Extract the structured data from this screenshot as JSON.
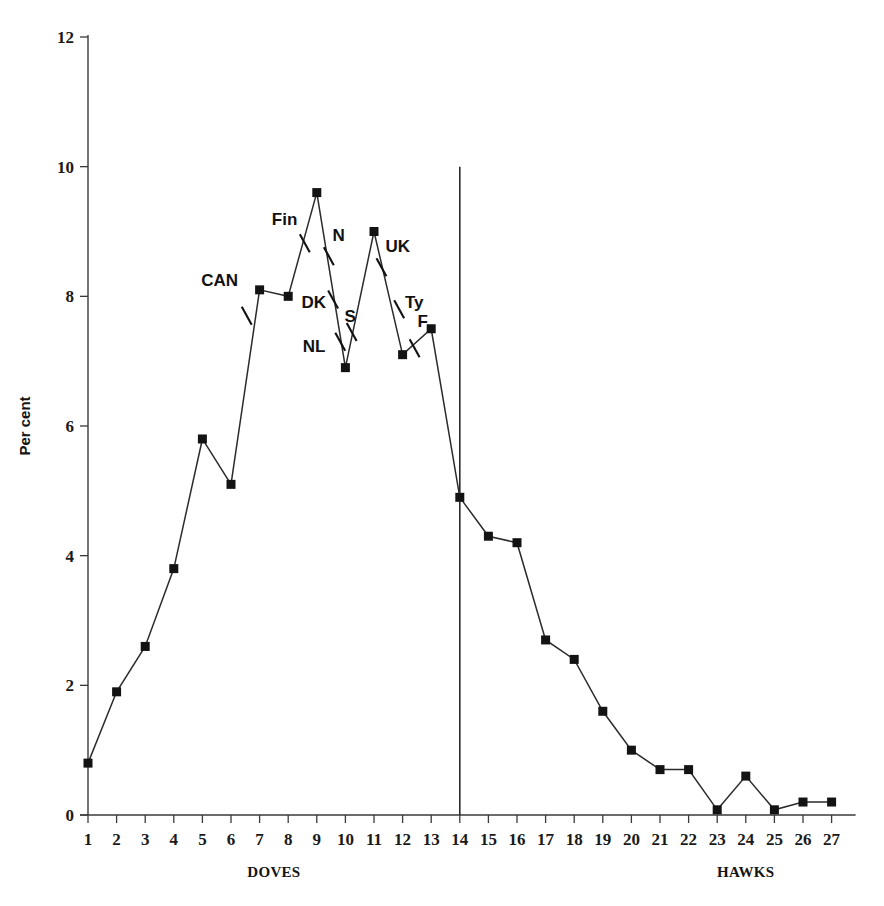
{
  "chart_data": {
    "type": "line",
    "title": "",
    "subtitle": "",
    "xlabel": "",
    "ylabel": "Per cent",
    "xlim": [
      0.4,
      27.6
    ],
    "ylim": [
      0,
      12
    ],
    "grid": false,
    "legend_position": "none",
    "x_tick_labels": [
      "1",
      "2",
      "3",
      "4",
      "5",
      "6",
      "7",
      "8",
      "9",
      "10",
      "11",
      "12",
      "13",
      "14",
      "15",
      "16",
      "17",
      "18",
      "19",
      "20",
      "21",
      "22",
      "23",
      "24",
      "25",
      "26",
      "27"
    ],
    "y_tick_labels": [
      "0",
      "2",
      "4",
      "6",
      "8",
      "10",
      "12"
    ],
    "y_ticks": [
      0,
      2,
      4,
      6,
      8,
      10,
      12
    ],
    "x": [
      1,
      2,
      3,
      4,
      5,
      6,
      7,
      8,
      9,
      10,
      11,
      12,
      13,
      14,
      15,
      16,
      17,
      18,
      19,
      20,
      21,
      22,
      23,
      24,
      25,
      26,
      27
    ],
    "values": [
      0.8,
      1.9,
      2.6,
      3.8,
      5.8,
      5.1,
      8.1,
      8.0,
      9.6,
      6.9,
      9.0,
      7.1,
      7.5,
      4.9,
      4.3,
      4.2,
      2.7,
      2.4,
      1.6,
      1.0,
      0.7,
      0.7,
      0.08,
      0.6,
      0.08,
      0.2,
      0.2
    ],
    "series": [
      {
        "name": "distribution",
        "values": [
          0.8,
          1.9,
          2.6,
          3.8,
          5.8,
          5.1,
          8.1,
          8.0,
          9.6,
          6.9,
          9.0,
          7.1,
          7.5,
          4.9,
          4.3,
          4.2,
          2.7,
          2.4,
          1.6,
          1.0,
          0.7,
          0.7,
          0.08,
          0.6,
          0.08,
          0.2,
          0.2
        ]
      }
    ],
    "marker_style": "filled-square",
    "line_color": "#2b2b2b",
    "marker_color": "#131313",
    "axis_group_labels": [
      {
        "text": "DOVES",
        "x_center": 7.5
      },
      {
        "text": "HAWKS",
        "x_center": 24.0
      }
    ],
    "reference_lines": [
      {
        "orientation": "vertical",
        "x": 14,
        "y_from": 0,
        "y_to": 10.0,
        "label": ""
      }
    ],
    "annotations": [
      {
        "text": "CAN",
        "x": 6.25,
        "y": 8.25,
        "anchor": "end",
        "tick_x": 6.55,
        "tick_y": 7.7
      },
      {
        "text": "Fin",
        "x": 8.32,
        "y": 9.2,
        "anchor": "end",
        "tick_x": 8.58,
        "tick_y": 8.82
      },
      {
        "text": "N",
        "x": 9.55,
        "y": 8.95,
        "anchor": "start",
        "tick_x": 9.42,
        "tick_y": 8.62
      },
      {
        "text": "DK",
        "x": 9.32,
        "y": 7.92,
        "anchor": "end",
        "tick_x": 9.57,
        "tick_y": 7.95
      },
      {
        "text": "S",
        "x": 9.97,
        "y": 7.7,
        "anchor": "start",
        "tick_x": 10.22,
        "tick_y": 7.45
      },
      {
        "text": "NL",
        "x": 9.3,
        "y": 7.23,
        "anchor": "end",
        "tick_x": 9.82,
        "tick_y": 7.3
      },
      {
        "text": "UK",
        "x": 11.4,
        "y": 8.78,
        "anchor": "start",
        "tick_x": 11.26,
        "tick_y": 8.45
      },
      {
        "text": "Ty",
        "x": 12.08,
        "y": 7.92,
        "anchor": "start",
        "tick_x": 11.88,
        "tick_y": 7.8
      },
      {
        "text": "F",
        "x": 12.52,
        "y": 7.62,
        "anchor": "start",
        "tick_x": 12.42,
        "tick_y": 7.2
      }
    ]
  }
}
